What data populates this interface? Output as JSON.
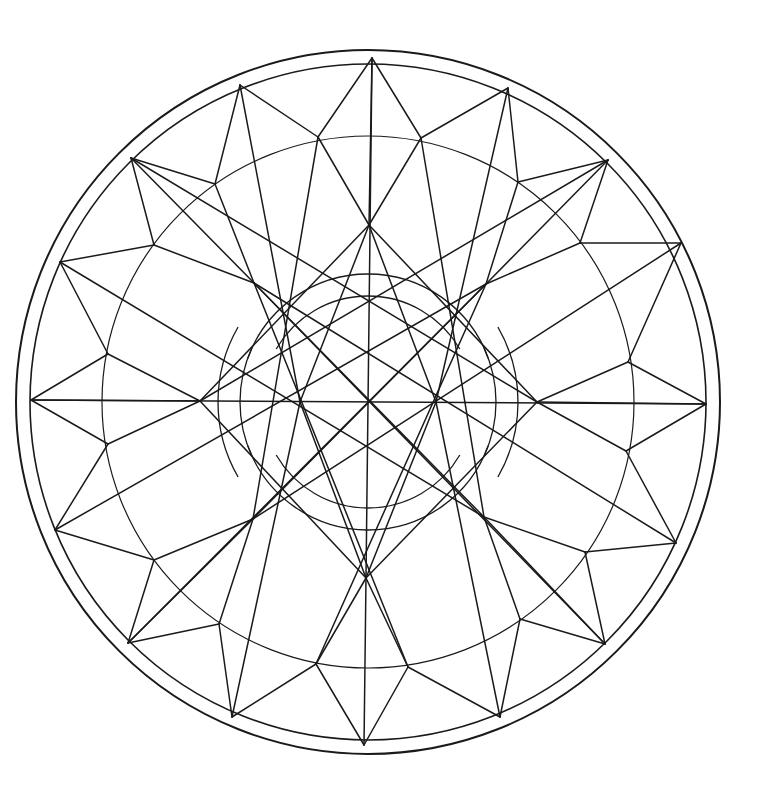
{
  "figure": {
    "title": "Geometric mandala line drawing",
    "width": 765,
    "height": 804,
    "stroke_color": "#1a1a1a",
    "background": "#ffffff",
    "center": [
      368,
      402
    ],
    "circles": [
      {
        "name": "outer-border-ring",
        "r": 352,
        "w": 2.0
      },
      {
        "name": "inner-border-ring",
        "r": 338,
        "w": 1.6
      },
      {
        "name": "middle-ring",
        "r": 266,
        "w": 1.2
      }
    ],
    "inner_arcs": [
      {
        "r": 128,
        "start": 200,
        "end": 340
      },
      {
        "r": 106,
        "start": 210,
        "end": 330
      },
      {
        "r": 128,
        "start": 20,
        "end": 160
      },
      {
        "r": 106,
        "start": 30,
        "end": 150
      },
      {
        "r": 150,
        "start": 150,
        "end": 210
      },
      {
        "r": 128,
        "start": 155,
        "end": 205
      },
      {
        "r": 150,
        "start": 330,
        "end": 390
      },
      {
        "r": 128,
        "start": 335,
        "end": 385
      }
    ],
    "points": {
      "outer_tips": [
        [
          372,
          58
        ],
        [
          508,
          88
        ],
        [
          608,
          160
        ],
        [
          681,
          243
        ],
        [
          706,
          404
        ],
        [
          676,
          543
        ],
        [
          605,
          644
        ],
        [
          500,
          717
        ],
        [
          364,
          745
        ],
        [
          232,
          717
        ],
        [
          128,
          643
        ],
        [
          55,
          530
        ],
        [
          31,
          400
        ],
        [
          60,
          262
        ],
        [
          131,
          158
        ],
        [
          240,
          85
        ]
      ],
      "middle_pts": [
        [
          421,
          138
        ],
        [
          518,
          182
        ],
        [
          580,
          243
        ],
        [
          628,
          362
        ],
        [
          626,
          451
        ],
        [
          585,
          552
        ],
        [
          520,
          619
        ],
        [
          408,
          667
        ],
        [
          316,
          664
        ],
        [
          219,
          624
        ],
        [
          154,
          560
        ],
        [
          108,
          444
        ],
        [
          108,
          354
        ],
        [
          154,
          245
        ],
        [
          215,
          184
        ],
        [
          318,
          137
        ]
      ],
      "hubs": [
        [
          369,
          225
        ],
        [
          486,
          284
        ],
        [
          537,
          402
        ],
        [
          484,
          517
        ],
        [
          366,
          578
        ],
        [
          253,
          519
        ],
        [
          200,
          401
        ],
        [
          254,
          283
        ]
      ],
      "center": [
        368,
        402
      ],
      "inner_star": [
        [
          369,
          332
        ],
        [
          419,
          316
        ],
        [
          436,
          402
        ],
        [
          417,
          490
        ],
        [
          367,
          469
        ],
        [
          318,
          488
        ],
        [
          300,
          402
        ],
        [
          320,
          318
        ]
      ]
    },
    "segments": [
      [
        372,
        58,
        369,
        225
      ],
      [
        372,
        58,
        318,
        137
      ],
      [
        372,
        58,
        421,
        138
      ],
      [
        372,
        58,
        366,
        578
      ],
      [
        508,
        88,
        421,
        138
      ],
      [
        508,
        88,
        518,
        182
      ],
      [
        608,
        160,
        518,
        182
      ],
      [
        608,
        160,
        486,
        284
      ],
      [
        608,
        160,
        580,
        243
      ],
      [
        681,
        243,
        580,
        243
      ],
      [
        681,
        243,
        628,
        362
      ],
      [
        706,
        404,
        537,
        402
      ],
      [
        706,
        404,
        628,
        362
      ],
      [
        706,
        404,
        626,
        451
      ],
      [
        706,
        404,
        31,
        400
      ],
      [
        676,
        543,
        626,
        451
      ],
      [
        676,
        543,
        585,
        552
      ],
      [
        605,
        644,
        585,
        552
      ],
      [
        605,
        644,
        484,
        517
      ],
      [
        605,
        644,
        520,
        619
      ],
      [
        500,
        717,
        520,
        619
      ],
      [
        500,
        717,
        408,
        667
      ],
      [
        364,
        745,
        366,
        578
      ],
      [
        364,
        745,
        408,
        667
      ],
      [
        364,
        745,
        316,
        664
      ],
      [
        232,
        717,
        316,
        664
      ],
      [
        232,
        717,
        219,
        624
      ],
      [
        128,
        643,
        219,
        624
      ],
      [
        128,
        643,
        253,
        519
      ],
      [
        128,
        643,
        154,
        560
      ],
      [
        55,
        530,
        154,
        560
      ],
      [
        55,
        530,
        108,
        444
      ],
      [
        31,
        400,
        200,
        401
      ],
      [
        31,
        400,
        108,
        444
      ],
      [
        31,
        400,
        108,
        354
      ],
      [
        60,
        262,
        108,
        354
      ],
      [
        60,
        262,
        154,
        245
      ],
      [
        131,
        158,
        154,
        245
      ],
      [
        131,
        158,
        254,
        283
      ],
      [
        131,
        158,
        215,
        184
      ],
      [
        240,
        85,
        215,
        184
      ],
      [
        240,
        85,
        318,
        137
      ],
      [
        318,
        137,
        369,
        225
      ],
      [
        421,
        138,
        369,
        225
      ],
      [
        518,
        182,
        486,
        284
      ],
      [
        580,
        243,
        486,
        284
      ],
      [
        628,
        362,
        537,
        402
      ],
      [
        626,
        451,
        537,
        402
      ],
      [
        585,
        552,
        484,
        517
      ],
      [
        520,
        619,
        484,
        517
      ],
      [
        408,
        667,
        366,
        578
      ],
      [
        316,
        664,
        366,
        578
      ],
      [
        219,
        624,
        253,
        519
      ],
      [
        154,
        560,
        253,
        519
      ],
      [
        108,
        444,
        200,
        401
      ],
      [
        108,
        354,
        200,
        401
      ],
      [
        154,
        245,
        254,
        283
      ],
      [
        215,
        184,
        254,
        283
      ],
      [
        131,
        158,
        537,
        402
      ],
      [
        608,
        160,
        200,
        401
      ],
      [
        128,
        643,
        486,
        284
      ],
      [
        605,
        644,
        254,
        283
      ],
      [
        60,
        262,
        484,
        517
      ],
      [
        681,
        243,
        253,
        519
      ],
      [
        55,
        530,
        486,
        284
      ],
      [
        676,
        543,
        254,
        283
      ],
      [
        421,
        138,
        484,
        517
      ],
      [
        318,
        137,
        253,
        519
      ],
      [
        408,
        667,
        254,
        283
      ],
      [
        316,
        664,
        486,
        284
      ],
      [
        369,
        225,
        537,
        402
      ],
      [
        369,
        225,
        200,
        401
      ],
      [
        366,
        578,
        537,
        402
      ],
      [
        366,
        578,
        200,
        401
      ],
      [
        369,
        225,
        436,
        402
      ],
      [
        369,
        225,
        300,
        402
      ],
      [
        366,
        578,
        436,
        402
      ],
      [
        366,
        578,
        300,
        402
      ],
      [
        254,
        283,
        484,
        517
      ],
      [
        486,
        284,
        253,
        519
      ],
      [
        508,
        88,
        436,
        402
      ],
      [
        240,
        85,
        300,
        402
      ],
      [
        500,
        717,
        436,
        402
      ],
      [
        232,
        717,
        300,
        402
      ]
    ]
  }
}
